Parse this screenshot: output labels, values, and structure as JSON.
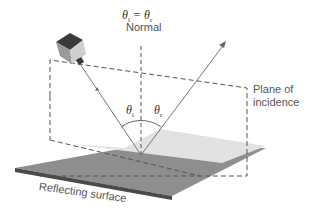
{
  "figure": {
    "equation": "θi = θr",
    "equation_parts": {
      "lhs": "θ",
      "lhs_sub": "i",
      "op": " = ",
      "rhs": "θ",
      "rhs_sub": "r"
    },
    "normal_label": "Normal",
    "plane_label_line1": "Plane of",
    "plane_label_line2": "incidence",
    "surface_label": "Reflecting surface",
    "angle_incident": {
      "symbol": "θ",
      "sub": "i"
    },
    "angle_reflected": {
      "symbol": "θ",
      "sub": "r"
    }
  },
  "colors": {
    "surface_top": "#8c8c8c",
    "surface_edge": "#4a4a4a",
    "plane_shade": "#e4e4e4",
    "line": "#777777",
    "dash": "#555555",
    "camera_light": "#c8c8c8",
    "camera_dark": "#3a3a3a"
  }
}
